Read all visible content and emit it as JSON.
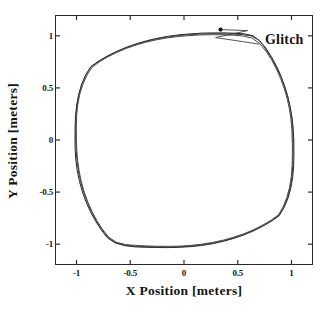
{
  "chart_data": {
    "type": "line",
    "title": "",
    "xlabel": "X  Position  [meters]",
    "ylabel": "Y  Position  [meters]",
    "xlim": [
      -1.2,
      1.2
    ],
    "ylim": [
      -1.2,
      1.2
    ],
    "grid": false,
    "legend": null,
    "xticks": [
      {
        "value": -1,
        "label": "-1"
      },
      {
        "value": -0.5,
        "label": "-0.5"
      },
      {
        "value": 0,
        "label": "0"
      },
      {
        "value": 0.5,
        "label": "0.5"
      },
      {
        "value": 1,
        "label": "1"
      }
    ],
    "yticks": [
      {
        "value": 1,
        "label": "1"
      },
      {
        "value": 0.5,
        "label": "0.5"
      },
      {
        "value": 0,
        "label": "0"
      },
      {
        "value": -0.5,
        "label": "-0.5"
      },
      {
        "value": -1,
        "label": "-1"
      }
    ],
    "series": [
      {
        "name": "trajectory-pass-1",
        "radius": 1.02,
        "color": "#262626",
        "points": [
          [
            1.021,
            0.0
          ],
          [
            1.016,
            0.104
          ],
          [
            1.006,
            0.208
          ],
          [
            0.989,
            0.311
          ],
          [
            0.966,
            0.412
          ],
          [
            0.936,
            0.511
          ],
          [
            0.901,
            0.607
          ],
          [
            0.86,
            0.7
          ],
          [
            0.813,
            0.789
          ],
          [
            0.761,
            0.873
          ],
          [
            0.704,
            0.952
          ],
          [
            0.642,
            1.001
          ],
          [
            0.56,
            1.019
          ],
          [
            0.47,
            1.025
          ],
          [
            0.372,
            1.028
          ],
          [
            0.27,
            1.028
          ],
          [
            0.166,
            1.026
          ],
          [
            0.062,
            1.019
          ],
          [
            -0.042,
            1.01
          ],
          [
            -0.145,
            0.996
          ],
          [
            -0.247,
            0.977
          ],
          [
            -0.346,
            0.953
          ],
          [
            -0.443,
            0.924
          ],
          [
            -0.536,
            0.89
          ],
          [
            -0.625,
            0.851
          ],
          [
            -0.71,
            0.808
          ],
          [
            -0.79,
            0.76
          ],
          [
            -0.864,
            0.707
          ],
          [
            -0.911,
            0.63
          ],
          [
            -0.95,
            0.54
          ],
          [
            -0.979,
            0.44
          ],
          [
            -0.998,
            0.336
          ],
          [
            -1.009,
            0.231
          ],
          [
            -1.013,
            0.125
          ],
          [
            -1.014,
            0.019
          ],
          [
            -1.013,
            -0.087
          ],
          [
            -1.006,
            -0.192
          ],
          [
            -0.993,
            -0.297
          ],
          [
            -0.972,
            -0.399
          ],
          [
            -0.945,
            -0.499
          ],
          [
            -0.911,
            -0.595
          ],
          [
            -0.871,
            -0.688
          ],
          [
            -0.824,
            -0.776
          ],
          [
            -0.772,
            -0.86
          ],
          [
            -0.714,
            -0.938
          ],
          [
            -0.64,
            -0.988
          ],
          [
            -0.55,
            -1.015
          ],
          [
            -0.455,
            -1.026
          ],
          [
            -0.356,
            -1.03
          ],
          [
            -0.254,
            -1.032
          ],
          [
            -0.15,
            -1.033
          ],
          [
            -0.046,
            -1.03
          ],
          [
            0.058,
            -1.024
          ],
          [
            0.162,
            -1.013
          ],
          [
            0.264,
            -0.996
          ],
          [
            0.364,
            -0.973
          ],
          [
            0.461,
            -0.945
          ],
          [
            0.555,
            -0.912
          ],
          [
            0.645,
            -0.873
          ],
          [
            0.73,
            -0.829
          ],
          [
            0.81,
            -0.781
          ],
          [
            0.884,
            -0.728
          ],
          [
            0.93,
            -0.65
          ],
          [
            0.967,
            -0.56
          ],
          [
            0.994,
            -0.461
          ],
          [
            1.011,
            -0.357
          ],
          [
            1.02,
            -0.251
          ],
          [
            1.022,
            -0.145
          ],
          [
            1.022,
            -0.04
          ],
          [
            1.021,
            0.0
          ]
        ]
      },
      {
        "name": "trajectory-pass-2",
        "radius": 1.012,
        "color": "#3a3a3a",
        "points": [
          [
            1.014,
            0.02
          ],
          [
            1.01,
            0.124
          ],
          [
            1.0,
            0.228
          ],
          [
            0.984,
            0.33
          ],
          [
            0.962,
            0.43
          ],
          [
            0.933,
            0.528
          ],
          [
            0.899,
            0.623
          ],
          [
            0.859,
            0.714
          ],
          [
            0.813,
            0.801
          ],
          [
            0.761,
            0.884
          ],
          [
            0.7,
            0.956
          ],
          [
            0.628,
            0.999
          ],
          [
            0.544,
            1.012
          ],
          [
            0.452,
            1.017
          ],
          [
            0.353,
            1.02
          ],
          [
            0.251,
            1.02
          ],
          [
            0.147,
            1.017
          ],
          [
            0.043,
            1.011
          ],
          [
            -0.061,
            1.001
          ],
          [
            -0.164,
            0.987
          ],
          [
            -0.265,
            0.968
          ],
          [
            -0.364,
            0.944
          ],
          [
            -0.459,
            0.915
          ],
          [
            -0.551,
            0.881
          ],
          [
            -0.639,
            0.842
          ],
          [
            -0.722,
            0.799
          ],
          [
            -0.8,
            0.751
          ],
          [
            -0.871,
            0.697
          ],
          [
            -0.917,
            0.618
          ],
          [
            -0.953,
            0.528
          ],
          [
            -0.98,
            0.429
          ],
          [
            -0.997,
            0.325
          ],
          [
            -1.005,
            0.22
          ],
          [
            -1.007,
            0.114
          ],
          [
            -1.006,
            0.008
          ],
          [
            -1.003,
            -0.098
          ],
          [
            -0.995,
            -0.203
          ],
          [
            -0.98,
            -0.307
          ],
          [
            -0.959,
            -0.409
          ],
          [
            -0.931,
            -0.508
          ],
          [
            -0.897,
            -0.603
          ],
          [
            -0.857,
            -0.695
          ],
          [
            -0.811,
            -0.783
          ],
          [
            -0.759,
            -0.866
          ],
          [
            -0.7,
            -0.943
          ],
          [
            -0.626,
            -0.991
          ],
          [
            -0.537,
            -1.012
          ],
          [
            -0.443,
            -1.02
          ],
          [
            -0.345,
            -1.024
          ],
          [
            -0.243,
            -1.027
          ],
          [
            -0.14,
            -1.028
          ],
          [
            -0.036,
            -1.025
          ],
          [
            0.068,
            -1.018
          ],
          [
            0.171,
            -1.006
          ],
          [
            0.272,
            -0.989
          ],
          [
            0.371,
            -0.967
          ],
          [
            0.467,
            -0.939
          ],
          [
            0.56,
            -0.906
          ],
          [
            0.649,
            -0.868
          ],
          [
            0.733,
            -0.825
          ],
          [
            0.812,
            -0.777
          ],
          [
            0.884,
            -0.724
          ],
          [
            0.928,
            -0.646
          ],
          [
            0.962,
            -0.556
          ],
          [
            0.988,
            -0.458
          ],
          [
            1.004,
            -0.354
          ],
          [
            1.012,
            -0.248
          ],
          [
            1.014,
            -0.142
          ],
          [
            1.015,
            -0.037
          ],
          [
            1.014,
            0.02
          ]
        ]
      },
      {
        "name": "trajectory-pass-3",
        "radius": 1.006,
        "color": "#4a4a4a",
        "points": [
          [
            1.007,
            -0.01
          ],
          [
            1.004,
            0.094
          ],
          [
            0.995,
            0.198
          ],
          [
            0.98,
            0.3
          ],
          [
            0.959,
            0.4
          ],
          [
            0.931,
            0.498
          ],
          [
            0.898,
            0.592
          ],
          [
            0.859,
            0.683
          ],
          [
            0.814,
            0.77
          ],
          [
            0.763,
            0.852
          ],
          [
            0.704,
            0.926
          ],
          [
            0.634,
            0.978
          ],
          [
            0.552,
            0.998
          ],
          [
            0.462,
            1.006
          ],
          [
            0.364,
            1.01
          ],
          [
            0.263,
            1.011
          ],
          [
            0.159,
            1.009
          ],
          [
            0.056,
            1.003
          ],
          [
            -0.048,
            0.994
          ],
          [
            -0.151,
            0.981
          ],
          [
            -0.252,
            0.963
          ],
          [
            -0.35,
            0.94
          ],
          [
            -0.445,
            0.912
          ],
          [
            -0.537,
            0.879
          ],
          [
            -0.624,
            0.841
          ],
          [
            -0.707,
            0.799
          ],
          [
            -0.784,
            0.752
          ],
          [
            -0.855,
            0.699
          ],
          [
            -0.903,
            0.622
          ],
          [
            -0.941,
            0.534
          ],
          [
            -0.97,
            0.437
          ],
          [
            -0.989,
            0.334
          ],
          [
            -0.999,
            0.229
          ],
          [
            -1.002,
            0.124
          ],
          [
            -1.001,
            0.018
          ],
          [
            -0.998,
            -0.088
          ],
          [
            -0.99,
            -0.193
          ],
          [
            -0.976,
            -0.296
          ],
          [
            -0.956,
            -0.398
          ],
          [
            -0.929,
            -0.497
          ],
          [
            -0.896,
            -0.592
          ],
          [
            -0.857,
            -0.684
          ],
          [
            -0.812,
            -0.772
          ],
          [
            -0.76,
            -0.855
          ],
          [
            -0.701,
            -0.932
          ],
          [
            -0.629,
            -0.982
          ],
          [
            -0.541,
            -1.004
          ],
          [
            -0.448,
            -1.012
          ],
          [
            -0.35,
            -1.017
          ],
          [
            -0.248,
            -1.02
          ],
          [
            -0.145,
            -1.021
          ],
          [
            -0.041,
            -1.019
          ],
          [
            0.063,
            -1.012
          ],
          [
            0.166,
            -1.0
          ],
          [
            0.267,
            -0.983
          ],
          [
            0.366,
            -0.961
          ],
          [
            0.462,
            -0.933
          ],
          [
            0.554,
            -0.901
          ],
          [
            0.643,
            -0.863
          ],
          [
            0.727,
            -0.82
          ],
          [
            0.806,
            -0.772
          ],
          [
            0.878,
            -0.72
          ],
          [
            0.922,
            -0.642
          ],
          [
            0.956,
            -0.552
          ],
          [
            0.982,
            -0.454
          ],
          [
            0.998,
            -0.351
          ],
          [
            1.006,
            -0.245
          ],
          [
            1.008,
            -0.139
          ],
          [
            1.008,
            -0.034
          ],
          [
            1.007,
            -0.01
          ]
        ]
      }
    ],
    "annotations": [
      {
        "name": "glitch",
        "label": "Glitch",
        "point": [
          0.34,
          1.06
        ],
        "label_position": [
          0.7,
          0.92
        ],
        "marker": "dot"
      }
    ]
  },
  "axes": {
    "x_title": "X  Position  [meters]",
    "y_title": "Y  Position  [meters]"
  },
  "annotation": {
    "glitch_label": "Glitch"
  }
}
